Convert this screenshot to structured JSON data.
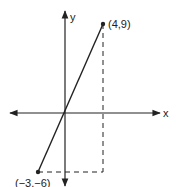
{
  "diagram": {
    "axes": {
      "x_label": "x",
      "y_label": "y"
    },
    "points": [
      {
        "label": "(4,9)",
        "x": 4,
        "y": 9
      },
      {
        "label": "(−3,−6)",
        "x": -3,
        "y": -6
      }
    ],
    "segment": {
      "from": "(−3,−6)",
      "to": "(4,9)",
      "style": "solid"
    },
    "guides": [
      {
        "description": "vertical dashed line from (4,9) down to y = -6",
        "style": "dashed"
      },
      {
        "description": "horizontal dashed line from (-3,-6) to x = 4",
        "style": "dashed"
      }
    ],
    "colors": {
      "ink": "#222222",
      "background": "#ffffff"
    }
  }
}
